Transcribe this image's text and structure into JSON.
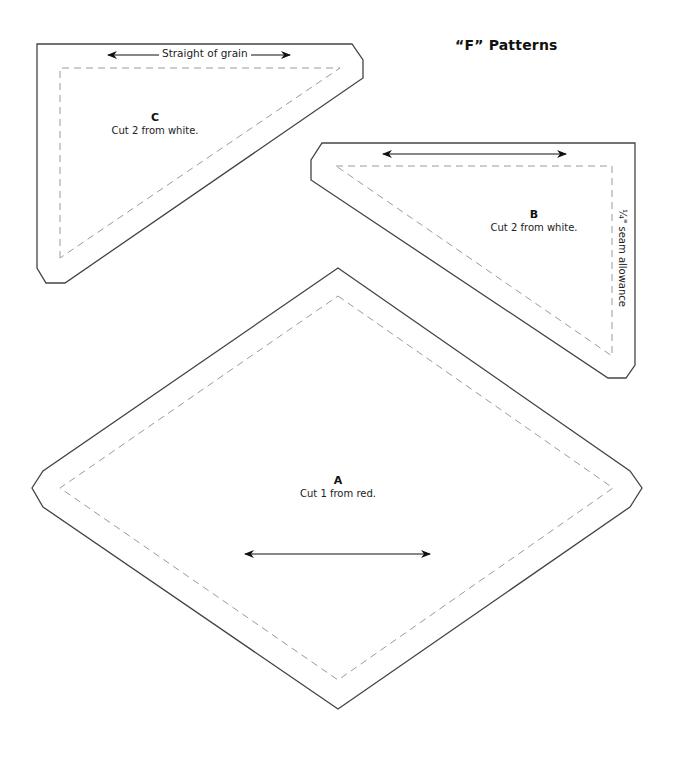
{
  "title": "“F” Patterns",
  "colors": {
    "cut_line": "#444444",
    "seam_line": "#9a9a9a",
    "text": "#222222"
  },
  "pieces": [
    {
      "id": "C",
      "letter": "C",
      "instruction": "Cut 2 from white.",
      "shape": "right-triangle",
      "grain_label": "Straight of grain"
    },
    {
      "id": "B",
      "letter": "B",
      "instruction": "Cut 2 from white.",
      "shape": "right-triangle",
      "seam_label": "¼\" seam allowance"
    },
    {
      "id": "A",
      "letter": "A",
      "instruction": "Cut 1 from red.",
      "shape": "diamond"
    }
  ],
  "icons": {
    "grain_arrow": "double-headed-arrow"
  }
}
